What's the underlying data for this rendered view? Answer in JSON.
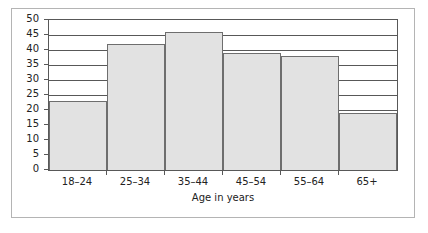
{
  "chart_data": {
    "type": "bar",
    "title": "",
    "subtitle": "",
    "xlabel": "Age in years",
    "ylabel": "",
    "categories": [
      "18–24",
      "25–34",
      "35–44",
      "45–54",
      "55–64",
      "65+"
    ],
    "values": [
      23,
      42,
      46,
      39,
      38,
      19
    ],
    "series": [
      {
        "name": "",
        "values": [
          23,
          42,
          46,
          39,
          38,
          19
        ]
      }
    ],
    "ylim": [
      0,
      50
    ],
    "xlim": [
      0,
      6
    ],
    "ytick_labels": [
      "0",
      "5",
      "10",
      "15",
      "20",
      "25",
      "30",
      "35",
      "40",
      "45",
      "50"
    ],
    "ytick_values": [
      0,
      5,
      10,
      15,
      20,
      25,
      30,
      35,
      40,
      45,
      50
    ],
    "y_tick_step": 5,
    "grid": true,
    "grid_axis": "y",
    "legend": false,
    "legend_position": "none",
    "bar_gap": 0,
    "colors": {
      "bar_fill": "#e2e2e2",
      "bar_edge": "#6e6e6e",
      "axis": "#585858",
      "grid": "#585858",
      "text": "#222222",
      "frame": "#b4b4b4",
      "background": "#ffffff"
    },
    "annotations": []
  }
}
